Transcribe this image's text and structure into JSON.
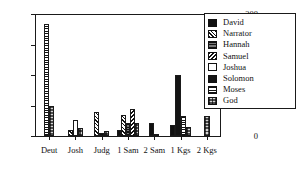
{
  "chart_data": {
    "type": "bar",
    "title": "",
    "xlabel": "",
    "ylabel": "",
    "ylim": [
      0,
      200
    ],
    "yticks": [
      0,
      50,
      100,
      150,
      200
    ],
    "ytick_labels": [
      "0",
      "",
      "100",
      "",
      "200"
    ],
    "grid": false,
    "legend_position": "top-right",
    "categories": [
      "Deut",
      "Josh",
      "Judg",
      "1 Sam",
      "2 Sam",
      "1 Kgs",
      "2 Kgs"
    ],
    "series": [
      {
        "name": "David",
        "pattern": "solid-black",
        "values": [
          0,
          0,
          0,
          10,
          22,
          18,
          0
        ]
      },
      {
        "name": "Narrator",
        "pattern": "diagonal-hatch",
        "values": [
          0,
          10,
          40,
          35,
          0,
          0,
          0
        ]
      },
      {
        "name": "Hannah",
        "pattern": "horizontal-dark",
        "values": [
          0,
          0,
          5,
          22,
          0,
          0,
          0
        ]
      },
      {
        "name": "Samuel",
        "pattern": "diagonal-hatch-2",
        "values": [
          0,
          0,
          0,
          45,
          0,
          0,
          0
        ]
      },
      {
        "name": "Joshua",
        "pattern": "white-empty",
        "values": [
          0,
          27,
          0,
          0,
          0,
          0,
          0
        ]
      },
      {
        "name": "Solomon",
        "pattern": "solid-black-2",
        "values": [
          0,
          0,
          0,
          0,
          0,
          100,
          0
        ]
      },
      {
        "name": "Moses",
        "pattern": "horizontal-lines",
        "values": [
          183,
          0,
          0,
          0,
          0,
          33,
          0
        ]
      },
      {
        "name": "God",
        "pattern": "stipple-grid",
        "values": [
          50,
          13,
          9,
          22,
          3,
          15,
          33
        ]
      }
    ]
  },
  "y_axis": {
    "ticks": [
      {
        "value": 200,
        "label": "200",
        "major": true
      },
      {
        "value": 150,
        "label": "",
        "major": false
      },
      {
        "value": 100,
        "label": "100",
        "major": true
      },
      {
        "value": 50,
        "label": "",
        "major": false
      },
      {
        "value": 0,
        "label": "0",
        "major": true
      }
    ]
  },
  "x_axis": {
    "groups": [
      {
        "label": "Deut"
      },
      {
        "label": "Josh"
      },
      {
        "label": "Judg"
      },
      {
        "label": "1 Sam"
      },
      {
        "label": "2 Sam"
      },
      {
        "label": "1 Kgs"
      },
      {
        "label": "2 Kgs"
      }
    ]
  },
  "legend": {
    "entries": [
      {
        "label": "David",
        "pattern": "solid-black"
      },
      {
        "label": "Narrator",
        "pattern": "diagonal-hatch"
      },
      {
        "label": "Hannah",
        "pattern": "horizontal-dark"
      },
      {
        "label": "Samuel",
        "pattern": "diagonal-hatch-2"
      },
      {
        "label": "Joshua",
        "pattern": "white-empty"
      },
      {
        "label": "Solomon",
        "pattern": "solid-black-2"
      },
      {
        "label": "Moses",
        "pattern": "horizontal-lines"
      },
      {
        "label": "God",
        "pattern": "stipple-grid"
      }
    ]
  },
  "colors": {
    "axis": "#1a1a1a",
    "ink": "#111111",
    "background": "#ffffff"
  }
}
